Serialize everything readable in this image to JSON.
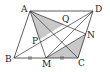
{
  "diagram": {
    "type": "geometry",
    "shape": "parallelogram ABCD",
    "stroke_color": "#333333",
    "shade_color": "#c8c8c8",
    "points": {
      "A": {
        "label": "A",
        "x": 30,
        "y": 11
      },
      "D": {
        "label": "D",
        "x": 93,
        "y": 11
      },
      "B": {
        "label": "B",
        "x": 14,
        "y": 58
      },
      "C": {
        "label": "C",
        "x": 78,
        "y": 58
      },
      "M": {
        "label": "M",
        "x": 46,
        "y": 58
      },
      "N": {
        "label": "N",
        "x": 86,
        "y": 34
      },
      "Q": {
        "label": "Q",
        "x": 64,
        "y": 24
      },
      "P": {
        "label": "P",
        "x": 39,
        "y": 40
      }
    },
    "tick_marks": [
      "BM",
      "MC"
    ]
  }
}
